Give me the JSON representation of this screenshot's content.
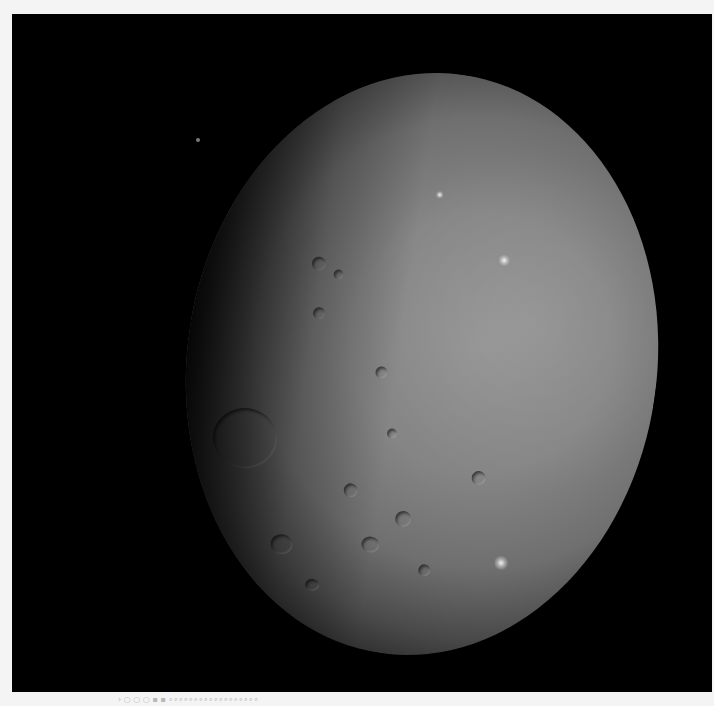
{
  "image": {
    "subject": "Dwarf planet Ceres, partially illuminated (terminator on the left)",
    "background_color": "#000000",
    "frame_color": "#f4f4f4",
    "surface_color": "#858585"
  },
  "features": {
    "bright_spots": [
      {
        "x": 515,
        "y": 243
      },
      {
        "x": 553,
        "y": 543
      },
      {
        "x": 430,
        "y": 190
      }
    ],
    "large_crater": {
      "x": 240,
      "y": 440,
      "r": 32
    },
    "background_star": {
      "x": 198,
      "y": 140
    }
  },
  "footer": {
    "marks": "› ○ ○ ○ ▪ ▪ ∘∘∘∘∘∘∘∘∘∘∘∘∘∘∘∘∘∘"
  }
}
